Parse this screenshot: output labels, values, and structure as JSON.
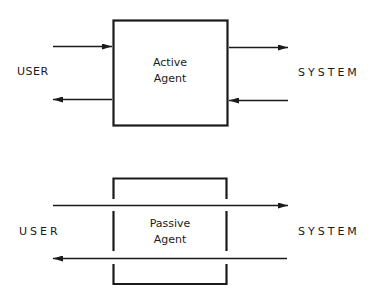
{
  "diagrams": [
    {
      "id": "active",
      "left_label": "USER",
      "right_label": "SYSTEM",
      "agent_title_line1": "Active",
      "agent_title_line2": "Agent",
      "box_style": "closed",
      "arrows": [
        {
          "side": "left",
          "direction": "into-agent"
        },
        {
          "side": "left",
          "direction": "out-to-user"
        },
        {
          "side": "right",
          "direction": "out-to-system"
        },
        {
          "side": "right",
          "direction": "into-agent"
        }
      ]
    },
    {
      "id": "passive",
      "left_label": "USER",
      "right_label": "SYSTEM",
      "agent_title_line1": "Passive",
      "agent_title_line2": "Agent",
      "box_style": "open-walls",
      "arrows": [
        {
          "side": "through",
          "direction": "user-to-system"
        },
        {
          "side": "through",
          "direction": "system-to-user"
        }
      ]
    }
  ],
  "colors": {
    "ink": "#1a1a1a",
    "background": "#ffffff"
  }
}
